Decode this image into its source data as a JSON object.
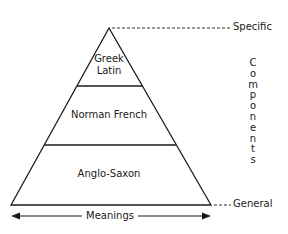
{
  "diagram": {
    "type": "pyramid",
    "layers": [
      {
        "label_lines": [
          "Greek",
          "Latin"
        ]
      },
      {
        "label_lines": [
          "Norman French"
        ]
      },
      {
        "label_lines": [
          "Anglo-Saxon"
        ]
      }
    ],
    "top_label": "Specific",
    "bottom_label": "General",
    "vertical_axis_label": "Components",
    "vertical_axis_letters": [
      "C",
      "o",
      "m",
      "p",
      "o",
      "n",
      "e",
      "n",
      "t",
      "s"
    ],
    "horizontal_axis_label": "Meanings"
  }
}
